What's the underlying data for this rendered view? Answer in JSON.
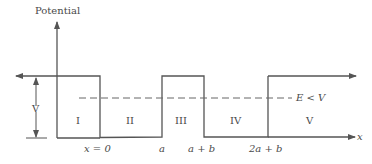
{
  "title": "Potential",
  "axis": {
    "y_label": "Potential",
    "x_label": "x"
  },
  "barrier": {
    "height_label": "V",
    "energy_label": "E < V"
  },
  "regions": [
    {
      "id": "I",
      "label": "I"
    },
    {
      "id": "II",
      "label": "II"
    },
    {
      "id": "III",
      "label": "III"
    },
    {
      "id": "IV",
      "label": "IV"
    },
    {
      "id": "V",
      "label": "V"
    }
  ],
  "x_ticks": [
    {
      "label": "x = 0"
    },
    {
      "label": "a"
    },
    {
      "label": "a + b"
    },
    {
      "label": "2a + b"
    }
  ],
  "colors": {
    "line": "#555555",
    "dashed": "#666666",
    "text": "#4a4a4a"
  }
}
